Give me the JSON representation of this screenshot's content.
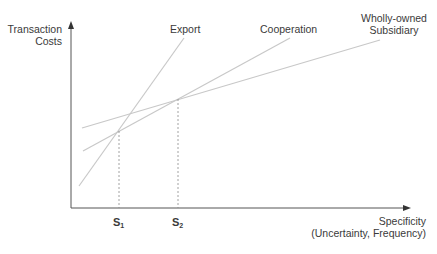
{
  "diagram": {
    "y_axis": {
      "label_line1": "Transaction",
      "label_line2": "Costs"
    },
    "x_axis": {
      "label_line1": "Specificity",
      "label_line2": "(Uncertainty, Frequency)"
    },
    "curves": [
      {
        "id": "export",
        "label": "Export",
        "x1": 79,
        "y1": 186,
        "x2": 184,
        "y2": 38
      },
      {
        "id": "cooperation",
        "label": "Cooperation",
        "x1": 83,
        "y1": 151,
        "x2": 290,
        "y2": 38
      },
      {
        "id": "wholly-owned",
        "label_line1": "Wholly-owned",
        "label_line2": "Subsidiary",
        "x1": 82,
        "y1": 128,
        "x2": 380,
        "y2": 40
      }
    ],
    "thresholds": [
      {
        "id": "s1",
        "label": "S",
        "subscript": "1",
        "x": 119,
        "y_top": 131
      },
      {
        "id": "s2",
        "label": "S",
        "subscript": "2",
        "x": 178,
        "y_top": 99
      }
    ],
    "colors": {
      "axis": "#555555",
      "curve": "#c8c8c8",
      "dashed": "#8a8a8a",
      "text": "#3a3a3a"
    }
  }
}
